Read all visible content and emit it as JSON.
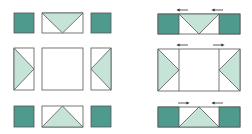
{
  "diagram": {
    "colors": {
      "dark_square": "#4e9a8c",
      "light_triangle": "#c5e3d6",
      "background": "#ffffff",
      "outline": "#555555",
      "arrow": "#333333"
    },
    "left_panel": {
      "label": "Units laid out",
      "rows": [
        {
          "name": "top",
          "units": [
            "corner-square",
            "flying-geese-down",
            "corner-square"
          ]
        },
        {
          "name": "middle",
          "units": [
            "flying-geese-right",
            "center-square",
            "flying-geese-left"
          ]
        },
        {
          "name": "bottom",
          "units": [
            "corner-square",
            "flying-geese-up",
            "corner-square"
          ]
        }
      ]
    },
    "right_panel": {
      "label": "Rows sewn with pressing arrows",
      "rows": [
        {
          "name": "top",
          "arrows": [
            "left",
            "left"
          ]
        },
        {
          "name": "middle",
          "arrows": [
            "left",
            "right"
          ]
        },
        {
          "name": "bottom",
          "arrows": [
            "right",
            "left"
          ]
        }
      ]
    }
  }
}
